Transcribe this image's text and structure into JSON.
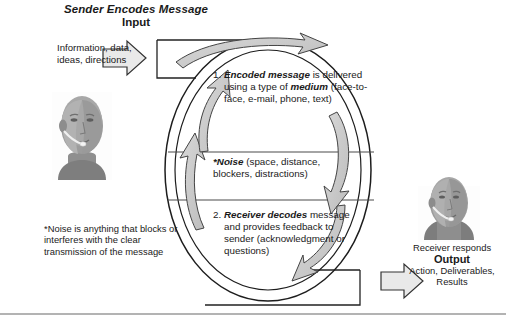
{
  "diagram": {
    "title": "Sender Encodes Message",
    "subtitle": "Input",
    "input_text": "Information, data, ideas, directions",
    "footnote": "*Noise is anything that blocks or interferes with the clear transmission of the message",
    "output": {
      "line1": "Receiver responds",
      "label": "Output",
      "items": "Action, Deliverables, Results"
    },
    "steps": [
      {
        "number": "1.",
        "lead": "Encoded message",
        "body": " is delivered using a type of ",
        "lead2": "medium",
        "body2": " (face-to-face, e-mail, phone, text)"
      },
      {
        "number": "2.",
        "lead": "Receiver decodes",
        "body": " message and provides feedback to sender (acknowledgment or questions)"
      }
    ],
    "noise": {
      "lead": "*Noise",
      "body": " (space, distance, blockers, distractions)"
    },
    "icons": {
      "input_arrow": "arrow-right-icon",
      "output_arrow": "arrow-right-icon",
      "sender": "sender-head-photo",
      "receiver": "receiver-head-photo",
      "cycle": "cycle-arrows-icon"
    },
    "colors": {
      "arrow_fill": "#e8e8e8",
      "arrow_stroke": "#3a3a3a",
      "segment_fill": "#c9c9c9",
      "segment_fill_light": "#dcdcdc",
      "line": "#555555",
      "text": "#1a1a1a",
      "rule": "#9a9a9a"
    }
  }
}
